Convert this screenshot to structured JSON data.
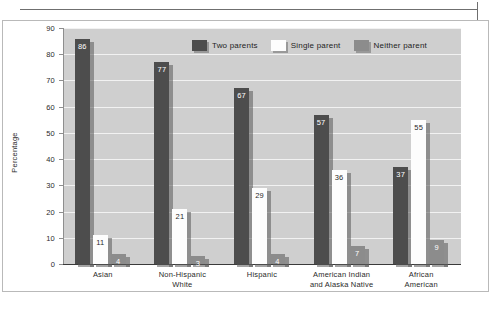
{
  "chart_data": {
    "type": "bar",
    "title": "",
    "xlabel": "",
    "ylabel": "Percentage",
    "ylim": [
      0,
      90
    ],
    "yticks": [
      0,
      10,
      20,
      30,
      40,
      50,
      60,
      70,
      80,
      90
    ],
    "grid": true,
    "legend_position": "top-center",
    "categories": [
      "Asian",
      "Non-Hispanic White",
      "Hispanic",
      "American Indian and Alaska Native",
      "African American"
    ],
    "category_lines": [
      [
        "Asian"
      ],
      [
        "Non-Hispanic",
        "White"
      ],
      [
        "Hispanic"
      ],
      [
        "American Indian",
        "and Alaska Native"
      ],
      [
        "African",
        "American"
      ]
    ],
    "series": [
      {
        "name": "Two parents",
        "color": "#4d4d4d",
        "values": [
          86,
          77,
          67,
          57,
          37
        ]
      },
      {
        "name": "Single parent",
        "color": "#fdfdfd",
        "values": [
          11,
          21,
          29,
          36,
          55
        ]
      },
      {
        "name": "Neither parent",
        "color": "#8c8c8c",
        "values": [
          4,
          3,
          4,
          7,
          9
        ]
      }
    ]
  },
  "axis": {
    "y_title": "Percentage",
    "y_ticks": [
      "90",
      "80",
      "70",
      "60",
      "50",
      "40",
      "30",
      "20",
      "10",
      "0"
    ]
  },
  "legend": {
    "items": [
      {
        "label": "Two parents"
      },
      {
        "label": "Single parent"
      },
      {
        "label": "Neither parent"
      }
    ]
  }
}
